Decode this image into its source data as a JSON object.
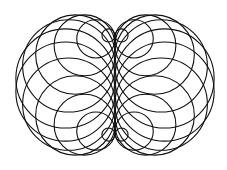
{
  "figure": {
    "center": [
      115,
      85
    ],
    "base_radius": 50,
    "circle_count": 24,
    "stroke_color": "#111111",
    "background": "#ffffff"
  }
}
